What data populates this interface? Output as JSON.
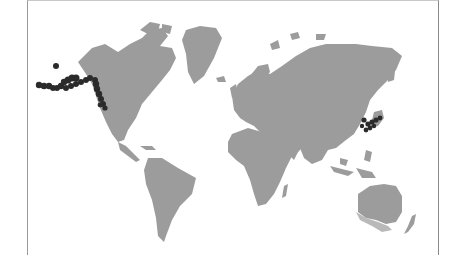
{
  "map": {
    "title": "World distribution map",
    "land_color": "#9c9c9c",
    "land_secondary_color": "#b9b9b9",
    "occurrence_color": "#2b2b2b",
    "background_color": "#ffffff",
    "highlighted_regions": [
      {
        "name": "Aleutian Islands / Alaska / Pacific Northwest coast",
        "marker": "dark dots"
      },
      {
        "name": "Japan / Korea coast",
        "marker": "dark dots"
      }
    ]
  }
}
